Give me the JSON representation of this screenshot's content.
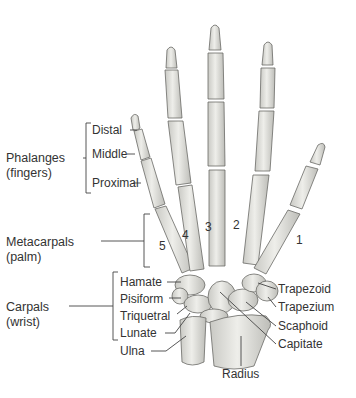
{
  "figure": {
    "groups": {
      "phalanges": {
        "line1": "Phalanges",
        "line2": "(fingers)",
        "parts": [
          "Distal",
          "Middle",
          "Proximal"
        ]
      },
      "metacarpals": {
        "line1": "Metacarpals",
        "line2": "(palm)",
        "numbers": [
          "1",
          "2",
          "3",
          "4",
          "5"
        ]
      },
      "carpals": {
        "line1": "Carpals",
        "line2": "(wrist)",
        "left_parts": [
          "Hamate",
          "Pisiform",
          "Triquetral",
          "Lunate"
        ]
      }
    },
    "left_other": [
      "Ulna"
    ],
    "right_labels": [
      "Trapezoid",
      "Trapezium",
      "Scaphoid",
      "Capitate"
    ],
    "bottom_label": "Radius",
    "colors": {
      "bone_fill": "#e4e4e0",
      "bone_stroke": "#6a6a66",
      "leader": "#444444",
      "text": "#333333"
    }
  }
}
